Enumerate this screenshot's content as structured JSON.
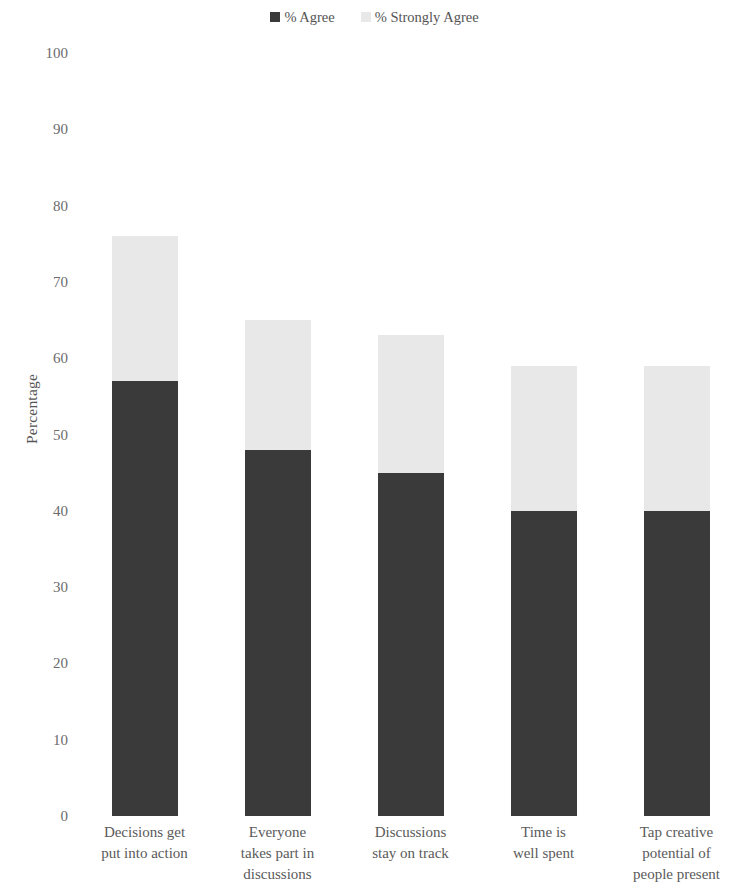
{
  "legend": {
    "position": "top-center",
    "items": [
      {
        "label": "% Agree",
        "color": "#3a3a3a",
        "swatch": "legend-swatch-agree"
      },
      {
        "label": "% Strongly Agree",
        "color": "#e8e8e8",
        "swatch": "legend-swatch-strongly-agree"
      }
    ]
  },
  "axes": {
    "ylabel": "Percentage",
    "yticks": [
      "0",
      "10",
      "20",
      "30",
      "40",
      "50",
      "60",
      "70",
      "80",
      "90",
      "100"
    ],
    "xlabel": ""
  },
  "chart_data": {
    "type": "bar",
    "title": "",
    "subtitle": "",
    "xlabel": "",
    "ylabel": "Percentage",
    "ylim": [
      0,
      100
    ],
    "ytick_step": 10,
    "grid": false,
    "stacked": true,
    "legend_position": "top-center",
    "categories": [
      "Decisions get put into action",
      "Everyone takes part in discussions",
      "Discussions stay on track",
      "Time is well spent",
      "Tap creative potential of people present"
    ],
    "category_lines": [
      [
        "Decisions get",
        "put into action"
      ],
      [
        "Everyone",
        "takes part in",
        "discussions"
      ],
      [
        "Discussions",
        "stay on track"
      ],
      [
        "Time is",
        "well spent"
      ],
      [
        "Tap creative",
        "potential of",
        "people present"
      ]
    ],
    "series": [
      {
        "name": "% Agree",
        "color": "#3a3a3a",
        "values": [
          57,
          48,
          45,
          40,
          40
        ]
      },
      {
        "name": "% Strongly Agree",
        "color": "#e8e8e8",
        "values": [
          19,
          17,
          18,
          19,
          19
        ]
      }
    ],
    "totals": [
      76,
      65,
      63,
      59,
      59
    ]
  }
}
